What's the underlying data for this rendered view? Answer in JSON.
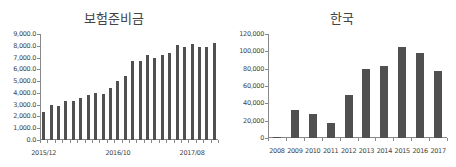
{
  "chart_data": [
    {
      "type": "bar",
      "title": "보험준비금",
      "xlabel": "",
      "ylabel": "",
      "ylim": [
        0,
        9000
      ],
      "yticks": [
        "0.0",
        "1,000.0",
        "2,000.0",
        "3,000.0",
        "4,000.0",
        "5,000.0",
        "6,000.0",
        "7,000.0",
        "8,000.0",
        "9,000.0"
      ],
      "categories": [
        "2015/12",
        "2016/01",
        "2016/02",
        "2016/03",
        "2016/04",
        "2016/05",
        "2016/06",
        "2016/07",
        "2016/08",
        "2016/09",
        "2016/10",
        "2016/11",
        "2016/12",
        "2017/01",
        "2017/02",
        "2017/03",
        "2017/04",
        "2017/05",
        "2017/06",
        "2017/07",
        "2017/08",
        "2017/09",
        "2017/10",
        "2017/11"
      ],
      "xtick_labels": [
        {
          "index": 0,
          "label": "2015/12"
        },
        {
          "index": 10,
          "label": "2016/10"
        },
        {
          "index": 20,
          "label": "2017/08"
        }
      ],
      "values": [
        2380,
        2960,
        2870,
        3280,
        3300,
        3570,
        3830,
        4000,
        3910,
        4430,
        5010,
        5420,
        6700,
        6700,
        7220,
        6960,
        7190,
        7390,
        8030,
        7910,
        8120,
        7860,
        7860,
        8200
      ],
      "bar_color": "#505050",
      "grid": false,
      "legend": null
    },
    {
      "type": "bar",
      "title": "한국",
      "xlabel": "",
      "ylabel": "",
      "ylim": [
        0,
        120000
      ],
      "yticks": [
        "0",
        "20,000",
        "40,000",
        "60,000",
        "80,000",
        "100,000",
        "120,000"
      ],
      "categories": [
        "2008",
        "2009",
        "2010",
        "2011",
        "2012",
        "2013",
        "2014",
        "2015",
        "2016",
        "2017"
      ],
      "values": [
        1200,
        32300,
        27700,
        17300,
        49200,
        80000,
        82700,
        105000,
        98000,
        77700
      ],
      "bar_color": "#505050",
      "grid": false,
      "legend": null
    }
  ]
}
